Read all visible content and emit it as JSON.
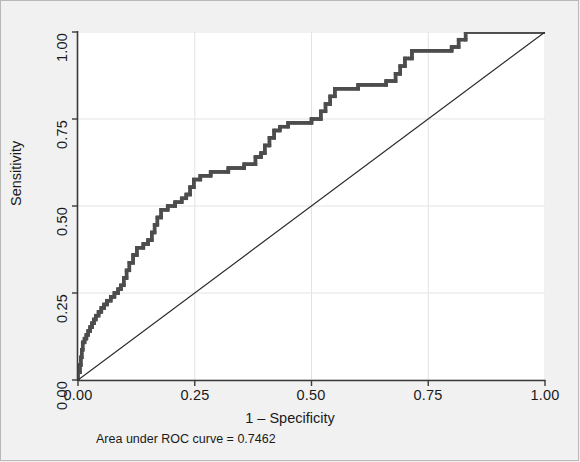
{
  "figure": {
    "background_color": "#f1f1f1",
    "plot_background_color": "#ffffff",
    "border_color": "#b8b8b8"
  },
  "note": {
    "text": "Area under ROC curve = 0.7462"
  },
  "axes": {
    "x_title": "1 – Specificity",
    "y_title": "Sensitivity",
    "x_ticks": [
      "0.00",
      "0.25",
      "0.50",
      "0.75",
      "1.00"
    ],
    "y_ticks": [
      "0.00",
      "0.25",
      "0.50",
      "0.75",
      "1.00"
    ]
  },
  "chart_data": {
    "type": "line",
    "title": "",
    "subtitle": "",
    "xlabel": "1 – Specificity",
    "ylabel": "Sensitivity",
    "xlim": [
      0.0,
      1.0
    ],
    "ylim": [
      0.0,
      1.0
    ],
    "xticks": [
      0.0,
      0.25,
      0.5,
      0.75,
      1.0
    ],
    "yticks": [
      0.0,
      0.25,
      0.5,
      0.75,
      1.0
    ],
    "grid": true,
    "legend": "none",
    "annotations": [
      "Area under ROC curve = 0.7462"
    ],
    "auc": 0.7462,
    "series": [
      {
        "name": "ROC curve",
        "style": "step",
        "color": "#4d4d4d",
        "marker": "square",
        "points": [
          [
            0.0,
            0.0
          ],
          [
            0.0,
            0.022
          ],
          [
            0.004,
            0.022
          ],
          [
            0.004,
            0.043
          ],
          [
            0.006,
            0.043
          ],
          [
            0.006,
            0.065
          ],
          [
            0.008,
            0.065
          ],
          [
            0.008,
            0.087
          ],
          [
            0.01,
            0.087
          ],
          [
            0.01,
            0.108
          ],
          [
            0.014,
            0.108
          ],
          [
            0.014,
            0.119
          ],
          [
            0.018,
            0.119
          ],
          [
            0.018,
            0.13
          ],
          [
            0.022,
            0.13
          ],
          [
            0.022,
            0.141
          ],
          [
            0.026,
            0.141
          ],
          [
            0.026,
            0.152
          ],
          [
            0.03,
            0.152
          ],
          [
            0.03,
            0.163
          ],
          [
            0.034,
            0.163
          ],
          [
            0.034,
            0.174
          ],
          [
            0.038,
            0.174
          ],
          [
            0.038,
            0.185
          ],
          [
            0.044,
            0.185
          ],
          [
            0.044,
            0.196
          ],
          [
            0.05,
            0.196
          ],
          [
            0.05,
            0.207
          ],
          [
            0.056,
            0.207
          ],
          [
            0.056,
            0.217
          ],
          [
            0.062,
            0.217
          ],
          [
            0.062,
            0.228
          ],
          [
            0.07,
            0.228
          ],
          [
            0.07,
            0.239
          ],
          [
            0.078,
            0.239
          ],
          [
            0.078,
            0.25
          ],
          [
            0.086,
            0.25
          ],
          [
            0.086,
            0.261
          ],
          [
            0.092,
            0.261
          ],
          [
            0.092,
            0.272
          ],
          [
            0.098,
            0.272
          ],
          [
            0.098,
            0.293
          ],
          [
            0.104,
            0.293
          ],
          [
            0.104,
            0.315
          ],
          [
            0.11,
            0.315
          ],
          [
            0.11,
            0.337
          ],
          [
            0.118,
            0.337
          ],
          [
            0.118,
            0.359
          ],
          [
            0.126,
            0.359
          ],
          [
            0.126,
            0.38
          ],
          [
            0.14,
            0.38
          ],
          [
            0.14,
            0.391
          ],
          [
            0.15,
            0.391
          ],
          [
            0.15,
            0.402
          ],
          [
            0.158,
            0.402
          ],
          [
            0.158,
            0.424
          ],
          [
            0.164,
            0.424
          ],
          [
            0.164,
            0.446
          ],
          [
            0.17,
            0.446
          ],
          [
            0.17,
            0.467
          ],
          [
            0.178,
            0.467
          ],
          [
            0.178,
            0.489
          ],
          [
            0.192,
            0.489
          ],
          [
            0.192,
            0.5
          ],
          [
            0.208,
            0.5
          ],
          [
            0.208,
            0.511
          ],
          [
            0.222,
            0.511
          ],
          [
            0.222,
            0.522
          ],
          [
            0.232,
            0.522
          ],
          [
            0.232,
            0.533
          ],
          [
            0.24,
            0.533
          ],
          [
            0.24,
            0.554
          ],
          [
            0.248,
            0.554
          ],
          [
            0.248,
            0.576
          ],
          [
            0.262,
            0.576
          ],
          [
            0.262,
            0.587
          ],
          [
            0.284,
            0.587
          ],
          [
            0.284,
            0.598
          ],
          [
            0.322,
            0.598
          ],
          [
            0.322,
            0.609
          ],
          [
            0.356,
            0.609
          ],
          [
            0.356,
            0.62
          ],
          [
            0.38,
            0.62
          ],
          [
            0.38,
            0.641
          ],
          [
            0.392,
            0.641
          ],
          [
            0.392,
            0.652
          ],
          [
            0.4,
            0.652
          ],
          [
            0.4,
            0.674
          ],
          [
            0.41,
            0.674
          ],
          [
            0.41,
            0.696
          ],
          [
            0.42,
            0.696
          ],
          [
            0.42,
            0.717
          ],
          [
            0.432,
            0.717
          ],
          [
            0.432,
            0.728
          ],
          [
            0.45,
            0.728
          ],
          [
            0.45,
            0.739
          ],
          [
            0.5,
            0.739
          ],
          [
            0.5,
            0.75
          ],
          [
            0.52,
            0.75
          ],
          [
            0.52,
            0.772
          ],
          [
            0.53,
            0.772
          ],
          [
            0.53,
            0.793
          ],
          [
            0.54,
            0.793
          ],
          [
            0.54,
            0.815
          ],
          [
            0.55,
            0.815
          ],
          [
            0.55,
            0.837
          ],
          [
            0.6,
            0.837
          ],
          [
            0.6,
            0.848
          ],
          [
            0.66,
            0.848
          ],
          [
            0.66,
            0.859
          ],
          [
            0.68,
            0.859
          ],
          [
            0.68,
            0.88
          ],
          [
            0.69,
            0.88
          ],
          [
            0.69,
            0.902
          ],
          [
            0.7,
            0.902
          ],
          [
            0.7,
            0.924
          ],
          [
            0.715,
            0.924
          ],
          [
            0.715,
            0.946
          ],
          [
            0.8,
            0.946
          ],
          [
            0.8,
            0.957
          ],
          [
            0.815,
            0.957
          ],
          [
            0.815,
            0.978
          ],
          [
            0.83,
            0.978
          ],
          [
            0.83,
            1.0
          ],
          [
            1.0,
            1.0
          ]
        ]
      },
      {
        "name": "Reference line",
        "style": "line",
        "color": "#2b2b2b",
        "points": [
          [
            0.0,
            0.0
          ],
          [
            1.0,
            1.0
          ]
        ]
      }
    ]
  }
}
